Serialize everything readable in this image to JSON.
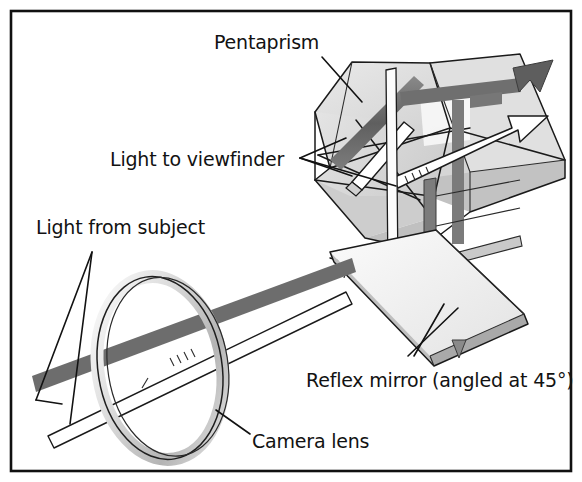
{
  "figure": {
    "width": 582,
    "height": 482,
    "background_color": "#ffffff",
    "border_color": "#111111",
    "style": "hand-drawn technical line illustration, grayscale"
  },
  "labels": {
    "pentaprism": "Pentaprism",
    "light_to_viewfinder": "Light to viewfinder",
    "light_from_subject": "Light from subject",
    "reflex_mirror": "Reflex mirror (angled at 45°)",
    "camera_lens": "Camera lens"
  },
  "components": [
    {
      "name": "pentaprism",
      "label": "Pentaprism",
      "description": "Five-sided roof prism at top right that erects the image",
      "fill_color": "#dcdcdc",
      "edge_color": "#1a1a1a"
    },
    {
      "name": "reflex-mirror",
      "label": "Reflex mirror (angled at 45°)",
      "description": "Flat rectangular mirror plate tilted 45 degrees below the prism",
      "angle_degrees": 45,
      "fill_color": "#f2f2f2",
      "edge_color": "#1a1a1a"
    },
    {
      "name": "camera-lens",
      "label": "Camera lens",
      "description": "Elliptical lens ring at lower left",
      "fill_color": "#efefef",
      "edge_color": "#1a1a1a"
    },
    {
      "name": "incoming-light-beam",
      "label": "Light from subject",
      "description": "Dark grey beam entering through the lens from the left",
      "color": "#6d6d6d"
    },
    {
      "name": "viewfinder-light-beam",
      "label": "Light to viewfinder",
      "description": "Beam reflected up through the pentaprism and out of the eyepiece",
      "color": "#6d6d6d"
    }
  ],
  "arrows": [
    {
      "name": "viewfinder-exit-arrow-dark",
      "style": "filled",
      "color": "#5e5e5e",
      "direction": "up-right"
    },
    {
      "name": "viewfinder-exit-arrow-outline",
      "style": "outlined",
      "color": "#ffffff",
      "direction": "up-right"
    },
    {
      "name": "mirror-pointer-arrow",
      "style": "filled",
      "color": "#8a8a8a",
      "direction": "down"
    }
  ],
  "colors": {
    "ink": "#121212",
    "prism_fill": "#dcdcdc",
    "prism_fill_light": "#ebebeb",
    "prism_fill_dark": "#c4c4c4",
    "beam_dark": "#6d6d6d",
    "beam_mid": "#8e8e8e",
    "mirror_fill": "#f4f4f4",
    "mirror_edge_shade": "#9a9a9a",
    "lens_fill": "#efefef",
    "lens_shade": "#c9c9c9",
    "white": "#ffffff"
  }
}
